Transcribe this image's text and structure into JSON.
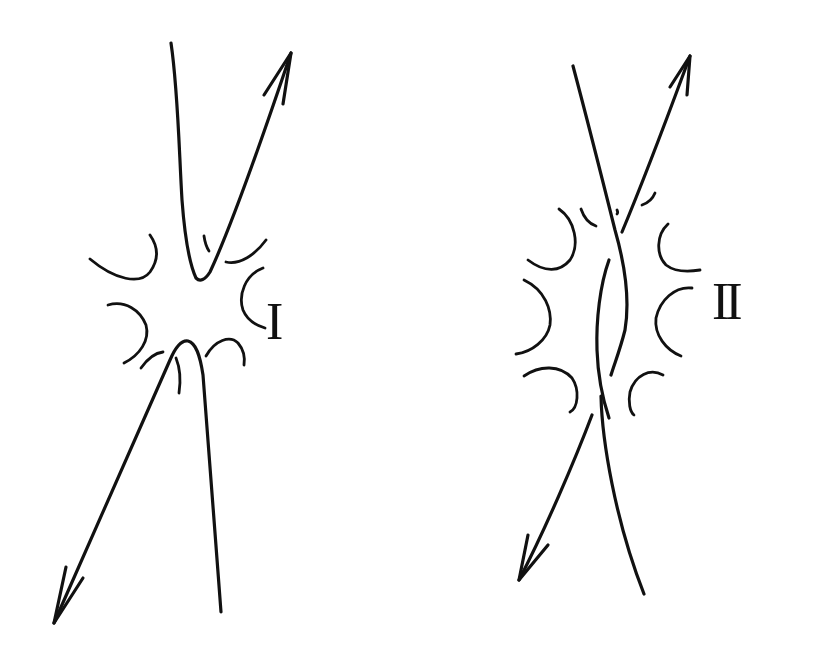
{
  "diagrams": [
    {
      "id": "I",
      "label": "I",
      "description": "Two strands approaching without crossing (smoothing), surrounded by arc fragments; upper strand pair forms a V with arrow pointing up-right, lower pair forms inverted V with arrow pointing down-left"
    },
    {
      "id": "II",
      "label": "II",
      "description": "Two strands crossing twice (a twisted pair), surrounded by arc fragments; arrow up-right at top and down-left at bottom"
    }
  ],
  "colors": {
    "ink": "#111111",
    "background": "#ffffff"
  }
}
